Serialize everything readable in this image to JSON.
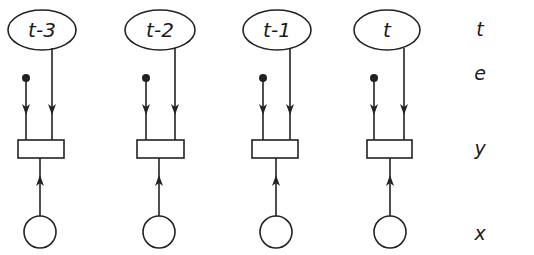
{
  "diagram": {
    "type": "time-slice graphical model",
    "columns": [
      {
        "time_label": "t-3",
        "cx": 42,
        "ellipse_rx": 34,
        "dot_x": 26,
        "line_x": 52,
        "box_x": 18,
        "box_w": 46,
        "circle_cx": 40
      },
      {
        "time_label": "t-2",
        "cx": 160,
        "ellipse_rx": 35,
        "dot_x": 146,
        "line_x": 175,
        "box_x": 137,
        "box_w": 47,
        "circle_cx": 159
      },
      {
        "time_label": "t-1",
        "cx": 277,
        "ellipse_rx": 34,
        "dot_x": 263,
        "line_x": 290,
        "box_x": 252,
        "box_w": 46,
        "circle_cx": 276
      },
      {
        "time_label": "t",
        "cx": 387,
        "ellipse_rx": 33,
        "dot_x": 374,
        "line_x": 404,
        "box_x": 367,
        "box_w": 45,
        "circle_cx": 390
      }
    ],
    "row_labels": [
      {
        "key": "time",
        "text": "t",
        "y": 36
      },
      {
        "key": "evidence",
        "text": "e",
        "y": 80
      },
      {
        "key": "output",
        "text": "y",
        "y": 155
      },
      {
        "key": "state",
        "text": "x",
        "y": 240
      }
    ],
    "layout": {
      "ellipse_cy": 30,
      "ellipse_ry": 20,
      "dot_y": 78,
      "dot_r": 4,
      "box_y": 140,
      "box_h": 18,
      "circle_cy": 232,
      "circle_r": 16,
      "row_label_x": 480
    }
  }
}
